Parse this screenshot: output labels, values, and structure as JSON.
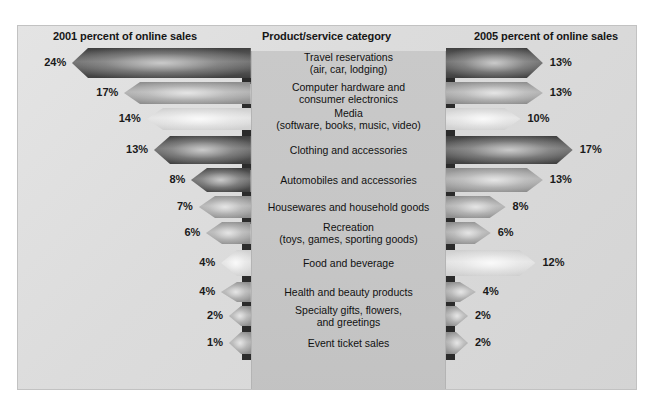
{
  "headers": {
    "left": "2001 percent of online sales",
    "center": "Product/service category",
    "right": "2005 percent of online sales"
  },
  "colors": {
    "frame_background": "#dcdcdc",
    "center_panel": "#c6c6c6",
    "text": "#161616",
    "arrow_dark": "#4a4a4a",
    "arrow_mid": "#8e8e8e",
    "arrow_light": "#d8d8d8",
    "arrow_shadow": "#2b2b2b"
  },
  "chart_data": {
    "type": "bar",
    "title": "Product/service category",
    "xlabel": "",
    "ylabel": "",
    "categories": [
      "Travel reservations (air, car, lodging)",
      "Computer hardware and consumer electronics",
      "Media (software, books, music, video)",
      "Clothing and accessories",
      "Automobiles and accessories",
      "Housewares and household goods",
      "Recreation (toys, games, sporting goods)",
      "Food and beverage",
      "Health and beauty products",
      "Specialty gifts, flowers, and greetings",
      "Event ticket sales"
    ],
    "series": [
      {
        "name": "2001 percent of online sales",
        "values": [
          24,
          17,
          14,
          13,
          8,
          7,
          6,
          4,
          4,
          2,
          1
        ]
      },
      {
        "name": "2005 percent of online sales",
        "values": [
          13,
          13,
          10,
          17,
          13,
          8,
          6,
          12,
          4,
          2,
          2
        ]
      }
    ],
    "xlim": [
      0,
      24
    ],
    "grid": false,
    "legend": "none"
  },
  "rows": [
    {
      "label_lines": [
        "Travel reservations",
        "(air, car, lodging)"
      ],
      "left_pct": "24%",
      "right_pct": "13%",
      "left_value": 24,
      "right_value": 13,
      "tone_left": "dark",
      "tone_right": "dark"
    },
    {
      "label_lines": [
        "Computer hardware and",
        "consumer electronics"
      ],
      "left_pct": "17%",
      "right_pct": "13%",
      "left_value": 17,
      "right_value": 13,
      "tone_left": "mid",
      "tone_right": "mid"
    },
    {
      "label_lines": [
        "Media",
        "(software, books, music, video)"
      ],
      "left_pct": "14%",
      "right_pct": "10%",
      "left_value": 14,
      "right_value": 10,
      "tone_left": "light",
      "tone_right": "light"
    },
    {
      "label_lines": [
        "Clothing and accessories"
      ],
      "left_pct": "13%",
      "right_pct": "17%",
      "left_value": 13,
      "right_value": 17,
      "tone_left": "dark",
      "tone_right": "dark"
    },
    {
      "label_lines": [
        "Automobiles and accessories"
      ],
      "left_pct": "8%",
      "right_pct": "13%",
      "left_value": 8,
      "right_value": 13,
      "tone_left": "dark",
      "tone_right": "mid"
    },
    {
      "label_lines": [
        "Housewares and household goods"
      ],
      "left_pct": "7%",
      "right_pct": "8%",
      "left_value": 7,
      "right_value": 8,
      "tone_left": "mid",
      "tone_right": "mid"
    },
    {
      "label_lines": [
        "Recreation",
        "(toys, games, sporting goods)"
      ],
      "left_pct": "6%",
      "right_pct": "6%",
      "left_value": 6,
      "right_value": 6,
      "tone_left": "mid",
      "tone_right": "mid"
    },
    {
      "label_lines": [
        "Food and beverage"
      ],
      "left_pct": "4%",
      "right_pct": "12%",
      "left_value": 4,
      "right_value": 12,
      "tone_left": "light",
      "tone_right": "light"
    },
    {
      "label_lines": [
        "Health and beauty products"
      ],
      "left_pct": "4%",
      "right_pct": "4%",
      "left_value": 4,
      "right_value": 4,
      "tone_left": "mid",
      "tone_right": "mid"
    },
    {
      "label_lines": [
        "Specialty gifts, flowers,",
        "and greetings"
      ],
      "left_pct": "2%",
      "right_pct": "2%",
      "left_value": 2,
      "right_value": 2,
      "tone_left": "mid",
      "tone_right": "mid"
    },
    {
      "label_lines": [
        "Event ticket sales"
      ],
      "left_pct": "1%",
      "right_pct": "2%",
      "left_value": 1,
      "right_value": 2,
      "tone_left": "mid",
      "tone_right": "mid"
    }
  ]
}
